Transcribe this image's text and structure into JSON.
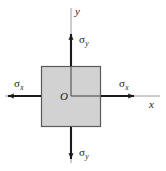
{
  "figure": {
    "type": "biaxial-stress-element-diagram",
    "background_color": "#ffffff",
    "element": {
      "shape": "square",
      "fill_color": "#d2d2d2",
      "stroke_color": "#5a5a5a",
      "x": 41,
      "y": 66,
      "width": 60,
      "height": 61
    },
    "origin": {
      "label": "O",
      "x": 71,
      "y": 96
    },
    "axes": {
      "color": "#8a8a8a",
      "x_axis": {
        "label": "x",
        "x1": 5,
        "x2": 160,
        "y": 96
      },
      "y_axis": {
        "label": "y",
        "x": 71,
        "y1": 8,
        "y2": 163
      }
    },
    "arrow_color": "#1a1a1a",
    "stress_arrows": [
      {
        "name": "sigma-x-left",
        "symbol": "σ",
        "subscript": "x",
        "direction": "left",
        "label_x": 14,
        "label_y": 80
      },
      {
        "name": "sigma-x-right",
        "symbol": "σ",
        "subscript": "x",
        "direction": "right",
        "label_x": 119,
        "label_y": 80
      },
      {
        "name": "sigma-y-top",
        "symbol": "σ",
        "subscript": "y",
        "direction": "up",
        "label_x": 79,
        "label_y": 36
      },
      {
        "name": "sigma-y-bottom",
        "symbol": "σ",
        "subscript": "y",
        "direction": "down",
        "label_x": 79,
        "label_y": 150
      }
    ]
  }
}
